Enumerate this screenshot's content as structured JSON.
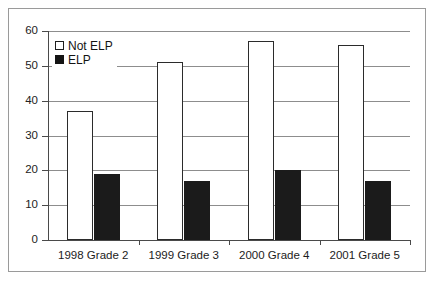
{
  "chart_data": {
    "type": "bar",
    "title": "",
    "subtitle": "",
    "xlabel": "",
    "ylabel": "",
    "categories": [
      "1998 Grade 2",
      "1999 Grade 3",
      "2000 Grade 4",
      "2001 Grade 5"
    ],
    "series": [
      {
        "name": "Not ELP",
        "values": [
          37,
          51,
          57,
          56
        ],
        "color": "#ffffff",
        "border": "#2b2b2b"
      },
      {
        "name": "ELP",
        "values": [
          19,
          17,
          20,
          17
        ],
        "color": "#1b1b1b",
        "border": "#1b1b1b"
      }
    ],
    "ylim": [
      0,
      60
    ],
    "yticks": [
      0,
      10,
      20,
      30,
      40,
      50,
      60
    ],
    "ytick_labels": [
      "0",
      "10",
      "20",
      "30",
      "40",
      "50",
      "60"
    ],
    "grid": true,
    "grid_axis": "y",
    "legend": {
      "position": "upper-left-inside",
      "entries": [
        {
          "label": "Not ELP",
          "swatch": "hollow-square"
        },
        {
          "label": "ELP",
          "swatch": "filled-square"
        }
      ]
    }
  }
}
